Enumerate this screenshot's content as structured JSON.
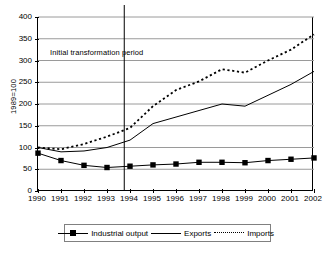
{
  "chart_data": {
    "type": "line",
    "title": "",
    "xlabel": "",
    "ylabel": "1989=100",
    "ylim": [
      0,
      400
    ],
    "ytick_values": [
      0,
      50,
      100,
      150,
      200,
      250,
      300,
      350,
      400
    ],
    "grid": true,
    "legend_position": "bottom",
    "categories": [
      "1990",
      "1991",
      "1992",
      "1993",
      "1994",
      "1995",
      "1996",
      "1997",
      "1998",
      "1999",
      "2000",
      "2001",
      "2002"
    ],
    "series": [
      {
        "name": "Industrial output",
        "style": "line-with-square-markers",
        "values": [
          87,
          70,
          59,
          54,
          57,
          60,
          62,
          66,
          66,
          65,
          70,
          73,
          76
        ]
      },
      {
        "name": "Exports",
        "style": "solid-line",
        "values": [
          100,
          90,
          92,
          100,
          117,
          155,
          170,
          185,
          200,
          195,
          220,
          245,
          275
        ]
      },
      {
        "name": "Imports",
        "style": "dotted-line",
        "values": [
          100,
          96,
          108,
          125,
          145,
          195,
          232,
          252,
          280,
          272,
          300,
          325,
          360
        ]
      }
    ],
    "annotations": [
      {
        "text": "Initial transformation period",
        "marker": "vertical-line",
        "x_position": 1993.75
      }
    ]
  },
  "legend": {
    "items": [
      {
        "label": "Industrial output"
      },
      {
        "label": "Exports"
      },
      {
        "label": "Imports"
      }
    ]
  },
  "colors": {
    "series": "#000000",
    "gridline": "#9a9a9a",
    "axis": "#000000",
    "background": "#ffffff"
  }
}
